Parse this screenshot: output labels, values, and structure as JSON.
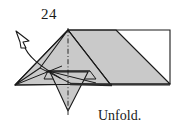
{
  "figure": {
    "step_number": "24",
    "caption": "Unfold.",
    "colors": {
      "paper_front": "#c9c9c9",
      "paper_back": "#ffffff",
      "line": "#1a1a1a",
      "text": "#1a1a1a",
      "background": "#ffffff",
      "shadow_edge": "#2b2b2b"
    },
    "arrow": {
      "name": "unfold-arrow",
      "type": "hollow-curved-arrow",
      "direction": "up-left",
      "meaning": "unfold"
    },
    "symmetry_line": {
      "name": "vertical-center-crease",
      "style": "dash-dot",
      "orientation": "vertical"
    },
    "shapes": [
      {
        "id": "right-white-panel",
        "fill": "paper_back"
      },
      {
        "id": "right-gray-panel",
        "fill": "paper_front"
      },
      {
        "id": "main-gray-body",
        "fill": "paper_front"
      },
      {
        "id": "left-wing",
        "fill": "paper_front"
      },
      {
        "id": "lower-point-flap",
        "fill": "paper_front"
      }
    ]
  }
}
